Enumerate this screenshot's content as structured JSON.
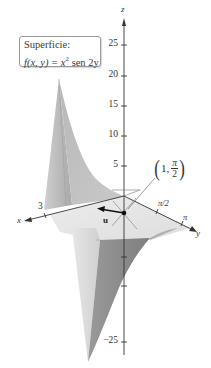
{
  "figure": {
    "surface_label": {
      "title": "Superficie:",
      "func_name": "f",
      "func_args": "(x, y) = ",
      "base": "x",
      "exponent": "2",
      "rest": " sen 2y"
    },
    "axes": {
      "z_label": "z",
      "x_label": "x",
      "y_label": "y",
      "z_ticks": [
        "25",
        "20",
        "15",
        "10",
        "5",
        "−25"
      ],
      "x_ticks": [
        "3"
      ],
      "y_ticks": [
        "π/2",
        "π"
      ]
    },
    "point": {
      "open": "(",
      "first": "1,",
      "num": "π",
      "den": "2",
      "close": ")"
    },
    "vector_label": "u",
    "colors": {
      "surface_light": "#d8d8d8",
      "surface_mid": "#b5b5b5",
      "surface_dark": "#8f8f8f",
      "axis": "#333333",
      "box_border": "#9a9a9a"
    }
  }
}
